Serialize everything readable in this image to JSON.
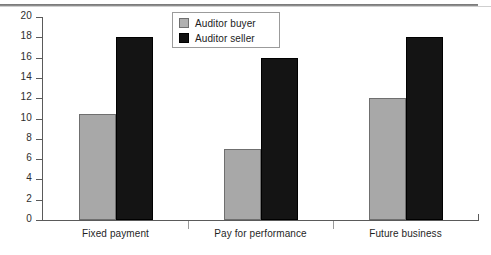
{
  "chart_data": {
    "type": "bar",
    "title": "",
    "subtitle": "",
    "xlabel": "",
    "ylabel": "",
    "categories": [
      "Fixed payment",
      "Pay for performance",
      "Future business"
    ],
    "series": [
      {
        "name": "Auditor buyer",
        "color": "#a8a8a8",
        "values": [
          10.4,
          7,
          12
        ]
      },
      {
        "name": "Auditor seller",
        "color": "#141414",
        "values": [
          18,
          16,
          18
        ]
      }
    ],
    "ylim": [
      0,
      20
    ],
    "yticks": [
      0,
      2,
      4,
      6,
      8,
      10,
      12,
      14,
      16,
      18,
      20
    ],
    "ytick_labels": [
      "0",
      "2",
      "4",
      "6",
      "8",
      "10",
      "12",
      "14",
      "16",
      "18",
      "20"
    ],
    "grid": false,
    "legend_position": "top-center",
    "legend_entries": [
      "Auditor buyer",
      "Auditor seller"
    ]
  }
}
